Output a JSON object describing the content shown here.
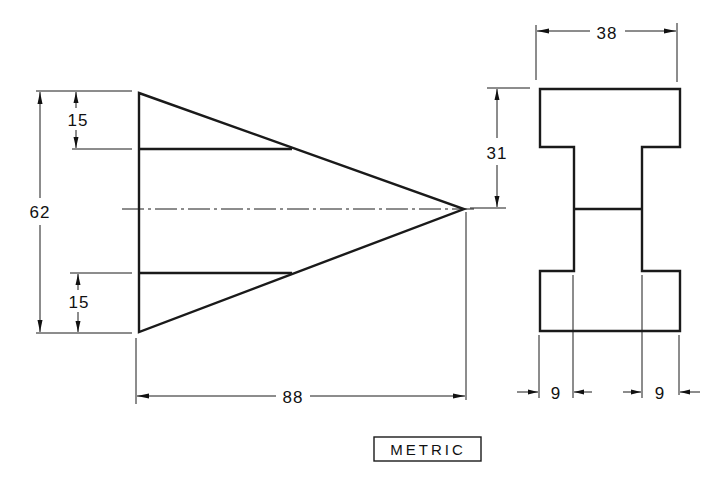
{
  "drawing": {
    "units_note": "METRIC",
    "front_view": {
      "name": "triangular-wedge",
      "dimensions": {
        "overall_height": "62",
        "top_step_height": "15",
        "bottom_step_height": "15",
        "overall_length": "88"
      }
    },
    "side_view": {
      "name": "i-section",
      "dimensions": {
        "overall_width": "38",
        "half_height": "31",
        "left_flange_overhang": "9",
        "right_flange_overhang": "9"
      }
    },
    "colors": {
      "line": "#1a1a1a",
      "background": "#ffffff"
    }
  }
}
